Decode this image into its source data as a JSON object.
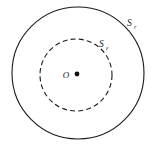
{
  "figure": {
    "name": "concentric-circles-diagram",
    "background_color": "#ffffff",
    "stroke_color": "#1a1a1a",
    "width": 153,
    "height": 145
  },
  "chart_data": {
    "type": "diagram",
    "title": "",
    "elements": [
      {
        "id": "outer-circle",
        "shape": "circle",
        "label": "S",
        "label_subscript": "r",
        "line_style": "solid",
        "center_x": 78,
        "center_y": 73,
        "radius": 66,
        "label_x": 127,
        "label_y": 26
      },
      {
        "id": "inner-circle",
        "shape": "circle",
        "label": "S",
        "label_subscript": "ε",
        "line_style": "dashed",
        "center_x": 76,
        "center_y": 75,
        "radius": 36,
        "label_x": 99,
        "label_y": 47
      },
      {
        "id": "center-point",
        "shape": "point",
        "label": "O",
        "filled": true,
        "x": 77,
        "y": 74,
        "dot_radius": 2.4,
        "label_x": 66,
        "label_y": 78
      }
    ],
    "xlabel": "",
    "ylabel": "",
    "grid": false,
    "legend": false
  },
  "labels": {
    "outer_symbol": "S",
    "outer_subscript": "r",
    "inner_symbol": "S",
    "inner_subscript": "ε",
    "center_symbol": "O"
  }
}
